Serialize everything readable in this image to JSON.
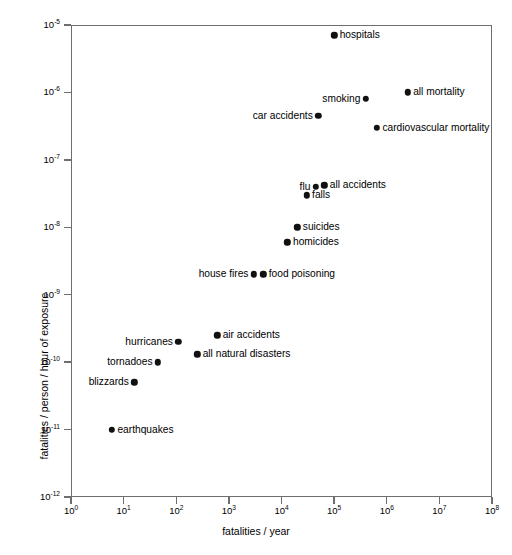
{
  "chart_data": {
    "type": "scatter",
    "title": "",
    "xlabel": "fatalities / year",
    "ylabel": "fatalities / person / hour of exposure",
    "xscale": "log",
    "yscale": "log",
    "xlim": [
      1,
      100000000
    ],
    "ylim": [
      1e-12,
      1e-05
    ],
    "grid": false,
    "legend": "none",
    "xticks": [
      {
        "value": 1,
        "label": "10",
        "exp": "0"
      },
      {
        "value": 10,
        "label": "10",
        "exp": "1"
      },
      {
        "value": 100,
        "label": "10",
        "exp": "2"
      },
      {
        "value": 1000,
        "label": "10",
        "exp": "3"
      },
      {
        "value": 10000,
        "label": "10",
        "exp": "4"
      },
      {
        "value": 100000,
        "label": "10",
        "exp": "5"
      },
      {
        "value": 1000000,
        "label": "10",
        "exp": "6"
      },
      {
        "value": 10000000,
        "label": "10",
        "exp": "7"
      },
      {
        "value": 100000000,
        "label": "10",
        "exp": "8"
      }
    ],
    "yticks": [
      {
        "value": 1e-05,
        "label": "10",
        "exp": "-5"
      },
      {
        "value": 1e-06,
        "label": "10",
        "exp": "-6"
      },
      {
        "value": 1e-07,
        "label": "10",
        "exp": "-7"
      },
      {
        "value": 1e-08,
        "label": "10",
        "exp": "-8"
      },
      {
        "value": 1e-09,
        "label": "10",
        "exp": "-9"
      },
      {
        "value": 1e-10,
        "label": "10",
        "exp": "-10"
      },
      {
        "value": 1e-11,
        "label": "10",
        "exp": "-11"
      },
      {
        "value": 1e-12,
        "label": "10",
        "exp": "-12"
      }
    ],
    "points": [
      {
        "label": "hospitals",
        "x": 100000.0,
        "y": 7e-06,
        "side": "right"
      },
      {
        "label": "all mortality",
        "x": 2500000.0,
        "y": 1e-06,
        "side": "right"
      },
      {
        "label": "smoking",
        "x": 400000.0,
        "y": 8e-07,
        "side": "left"
      },
      {
        "label": "car accidents",
        "x": 50000.0,
        "y": 4.5e-07,
        "side": "left"
      },
      {
        "label": "cardiovascular mortality",
        "x": 650000.0,
        "y": 3e-07,
        "side": "right"
      },
      {
        "label": "all accidents",
        "x": 65000.0,
        "y": 4.2e-08,
        "side": "right"
      },
      {
        "label": "flu",
        "x": 45000.0,
        "y": 4e-08,
        "side": "left"
      },
      {
        "label": "falls",
        "x": 30000.0,
        "y": 3e-08,
        "side": "right"
      },
      {
        "label": "suicides",
        "x": 20000.0,
        "y": 1e-08,
        "side": "right"
      },
      {
        "label": "homicides",
        "x": 13000.0,
        "y": 6e-09,
        "side": "right"
      },
      {
        "label": "food poisoning",
        "x": 4500.0,
        "y": 2e-09,
        "side": "right"
      },
      {
        "label": "house fires",
        "x": 3000.0,
        "y": 2e-09,
        "side": "left"
      },
      {
        "label": "air accidents",
        "x": 600.0,
        "y": 2.5e-10,
        "side": "right"
      },
      {
        "label": "hurricanes",
        "x": 110.0,
        "y": 2e-10,
        "side": "left"
      },
      {
        "label": "all natural disasters",
        "x": 250.0,
        "y": 1.3e-10,
        "side": "right"
      },
      {
        "label": "tornadoes",
        "x": 45.0,
        "y": 1e-10,
        "side": "left"
      },
      {
        "label": "blizzards",
        "x": 16.0,
        "y": 5e-11,
        "side": "left"
      },
      {
        "label": "earthquakes",
        "x": 6.0,
        "y": 1e-11,
        "side": "right"
      }
    ]
  }
}
